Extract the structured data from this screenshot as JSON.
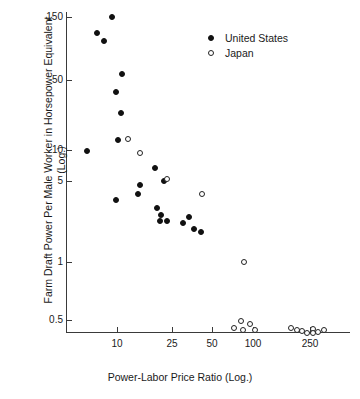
{
  "chart_data": {
    "type": "scatter",
    "title": "",
    "xlabel": "Power-Labor Price Ratio (Log.)",
    "ylabel": "Farm Draft Power Per Male Worker in Horsepower Equivalent (Log.)",
    "xscale": "log",
    "yscale": "log",
    "xlim": [
      5.5,
      400
    ],
    "ylim": [
      0.3,
      170
    ],
    "grid": false,
    "legend_position": "top-right",
    "xticks": [
      {
        "value": 10,
        "label": "10",
        "px": 117
      },
      {
        "value": 25,
        "label": "25",
        "px": 172
      },
      {
        "value": 50,
        "label": "50",
        "px": 212
      },
      {
        "value": 100,
        "label": "100",
        "px": 253
      },
      {
        "value": 250,
        "label": "250",
        "px": 310
      }
    ],
    "yticks": [
      {
        "value": 150,
        "label": "150",
        "px": 17
      },
      {
        "value": 50,
        "label": "50",
        "px": 80
      },
      {
        "value": 10,
        "label": "10",
        "px": 150
      },
      {
        "value": 5,
        "label": "5",
        "px": 181
      },
      {
        "value": 1,
        "label": "1",
        "px": 262
      },
      {
        "value": 0.5,
        "label": "0.5",
        "px": 320
      }
    ],
    "series": [
      {
        "name": "United States",
        "marker": "filled-circle",
        "color": "#111111",
        "points": [
          {
            "x": 9.3,
            "y": 150.0,
            "px": 112,
            "py": 17
          },
          {
            "x": 7.6,
            "y": 110.0,
            "px": 97,
            "py": 33
          },
          {
            "x": 8.4,
            "y": 95.0,
            "px": 104,
            "py": 41
          },
          {
            "x": 10.6,
            "y": 57.0,
            "px": 122,
            "py": 74
          },
          {
            "x": 9.9,
            "y": 40.0,
            "px": 116,
            "py": 92
          },
          {
            "x": 10.6,
            "y": 28.0,
            "px": 121,
            "py": 113
          },
          {
            "x": 10.3,
            "y": 14.5,
            "px": 118,
            "py": 140
          },
          {
            "x": 6.6,
            "y": 9.9,
            "px": 87,
            "py": 151
          },
          {
            "x": 18.8,
            "y": 6.7,
            "px": 155,
            "py": 168
          },
          {
            "x": 14.6,
            "y": 4.5,
            "px": 140,
            "py": 185
          },
          {
            "x": 21.8,
            "y": 4.9,
            "px": 164,
            "py": 181
          },
          {
            "x": 14.2,
            "y": 3.8,
            "px": 138,
            "py": 194
          },
          {
            "x": 9.9,
            "y": 3.3,
            "px": 116,
            "py": 200
          },
          {
            "x": 19.4,
            "y": 2.9,
            "px": 157,
            "py": 208
          },
          {
            "x": 20.8,
            "y": 2.6,
            "px": 161,
            "py": 215
          },
          {
            "x": 20.5,
            "y": 2.4,
            "px": 160,
            "py": 221
          },
          {
            "x": 22.4,
            "y": 2.4,
            "px": 167,
            "py": 221
          },
          {
            "x": 29.0,
            "y": 2.3,
            "px": 183,
            "py": 223
          },
          {
            "x": 32.5,
            "y": 2.5,
            "px": 189,
            "py": 217
          },
          {
            "x": 35.0,
            "y": 2.0,
            "px": 194,
            "py": 229
          },
          {
            "x": 40.0,
            "y": 1.9,
            "px": 201,
            "py": 232
          }
        ]
      },
      {
        "name": "Japan",
        "marker": "open-circle",
        "color": "#222222",
        "points": [
          {
            "x": 11.6,
            "y": 14.5,
            "px": 128,
            "py": 139
          },
          {
            "x": 14.5,
            "y": 9.4,
            "px": 140,
            "py": 153
          },
          {
            "x": 22.6,
            "y": 5.1,
            "px": 167,
            "py": 179
          },
          {
            "x": 40.5,
            "y": 3.7,
            "px": 202,
            "py": 194
          },
          {
            "x": 84.0,
            "y": 1.0,
            "px": 244,
            "py": 262
          },
          {
            "x": 80.0,
            "y": 0.48,
            "px": 241,
            "py": 321
          },
          {
            "x": 75.0,
            "y": 0.39,
            "px": 234,
            "py": 328
          },
          {
            "x": 82.0,
            "y": 0.38,
            "px": 243,
            "py": 330
          },
          {
            "x": 95.0,
            "y": 0.44,
            "px": 250,
            "py": 324
          },
          {
            "x": 103.0,
            "y": 0.38,
            "px": 255,
            "py": 330
          },
          {
            "x": 190.0,
            "y": 0.39,
            "px": 291,
            "py": 328
          },
          {
            "x": 205.0,
            "y": 0.38,
            "px": 297,
            "py": 330
          },
          {
            "x": 220.0,
            "y": 0.37,
            "px": 302,
            "py": 331
          },
          {
            "x": 235.0,
            "y": 0.35,
            "px": 307,
            "py": 333
          },
          {
            "x": 250.0,
            "y": 0.39,
            "px": 313,
            "py": 329
          },
          {
            "x": 252.0,
            "y": 0.36,
            "px": 313,
            "py": 333
          },
          {
            "x": 265.0,
            "y": 0.36,
            "px": 318,
            "py": 332
          },
          {
            "x": 285.0,
            "y": 0.38,
            "px": 324,
            "py": 330
          }
        ]
      }
    ]
  },
  "legend": {
    "items": [
      {
        "label": "United States",
        "marker": "filled-circle"
      },
      {
        "label": "Japan",
        "marker": "open-circle"
      }
    ]
  }
}
